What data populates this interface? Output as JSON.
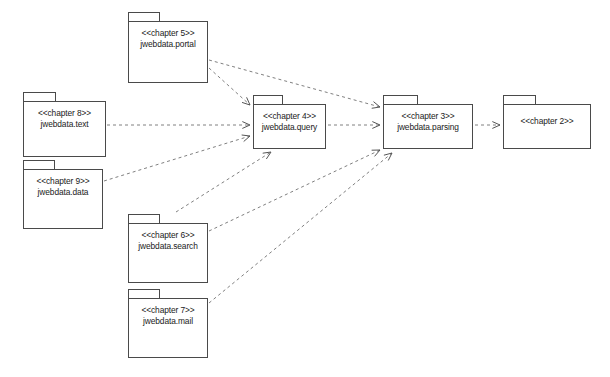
{
  "diagram": {
    "kind": "uml-package-diagram",
    "background_color": "#ffffff",
    "stroke_color": "#4a4a4a",
    "edge_color": "#808080",
    "text_color": "#1a1a1a"
  },
  "packages": [
    {
      "id": "chapter5",
      "stereotype": "<<chapter 5>>",
      "name": "jwebdata.portal",
      "x": 128,
      "y": 12,
      "tab_w": 32,
      "tab_h": 9,
      "body_y": 21,
      "w": 80,
      "body_h": 62
    },
    {
      "id": "chapter8",
      "stereotype": "<<chapter 8>>",
      "name": "jwebdata.text",
      "x": 23,
      "y": 92,
      "tab_w": 33,
      "tab_h": 9,
      "body_y": 101,
      "w": 83,
      "body_h": 56
    },
    {
      "id": "chapter9",
      "stereotype": "<<chapter 9>>",
      "name": "jwebdata.data",
      "x": 23,
      "y": 160,
      "tab_w": 32,
      "tab_h": 9,
      "body_y": 169,
      "w": 80,
      "body_h": 60
    },
    {
      "id": "chapter4",
      "stereotype": "<<chapter 4>>",
      "name": "jwebdata.query",
      "x": 253,
      "y": 95,
      "tab_w": 30,
      "tab_h": 9,
      "body_y": 104,
      "w": 73,
      "body_h": 45
    },
    {
      "id": "chapter3",
      "stereotype": "<<chapter 3>>",
      "name": "jwebdata.parsing",
      "x": 383,
      "y": 95,
      "tab_w": 35,
      "tab_h": 9,
      "body_y": 104,
      "w": 90,
      "body_h": 45
    },
    {
      "id": "chapter2",
      "stereotype": "<<chapter 2>>",
      "name": "",
      "x": 503,
      "y": 95,
      "tab_w": 33,
      "tab_h": 9,
      "body_y": 104,
      "w": 88,
      "body_h": 45
    },
    {
      "id": "chapter6",
      "stereotype": "<<chapter 6>>",
      "name": "jwebdata.search",
      "x": 128,
      "y": 214,
      "tab_w": 32,
      "tab_h": 9,
      "body_y": 223,
      "w": 80,
      "body_h": 60
    },
    {
      "id": "chapter7",
      "stereotype": "<<chapter 7>>",
      "name": "jwebdata.mail",
      "x": 128,
      "y": 289,
      "tab_w": 32,
      "tab_h": 9,
      "body_y": 298,
      "w": 80,
      "body_h": 60
    }
  ],
  "dependencies": [
    {
      "id": "dep-ch5-ch4",
      "from": "chapter5",
      "to": "chapter4",
      "x1": 209,
      "y1": 68,
      "x2": 250,
      "y2": 105
    },
    {
      "id": "dep-ch5-ch3",
      "from": "chapter5",
      "to": "chapter3",
      "x1": 209,
      "y1": 60,
      "x2": 380,
      "y2": 107
    },
    {
      "id": "dep-ch8-ch4",
      "from": "chapter8",
      "to": "chapter4",
      "x1": 107,
      "y1": 125,
      "x2": 250,
      "y2": 125
    },
    {
      "id": "dep-ch9-ch4",
      "from": "chapter9",
      "to": "chapter4",
      "x1": 104,
      "y1": 181,
      "x2": 250,
      "y2": 136
    },
    {
      "id": "dep-ch6-ch4",
      "from": "chapter6",
      "to": "chapter4",
      "x1": 176,
      "y1": 212,
      "x2": 271,
      "y2": 152
    },
    {
      "id": "dep-ch6-ch3",
      "from": "chapter6",
      "to": "chapter3",
      "x1": 209,
      "y1": 231,
      "x2": 380,
      "y2": 150
    },
    {
      "id": "dep-ch7-ch3",
      "from": "chapter7",
      "to": "chapter3",
      "x1": 209,
      "y1": 303,
      "x2": 392,
      "y2": 153
    },
    {
      "id": "dep-ch4-ch3",
      "from": "chapter4",
      "to": "chapter3",
      "x1": 328,
      "y1": 125,
      "x2": 380,
      "y2": 125
    },
    {
      "id": "dep-ch3-ch2",
      "from": "chapter3",
      "to": "chapter2",
      "x1": 475,
      "y1": 125,
      "x2": 500,
      "y2": 125
    }
  ]
}
